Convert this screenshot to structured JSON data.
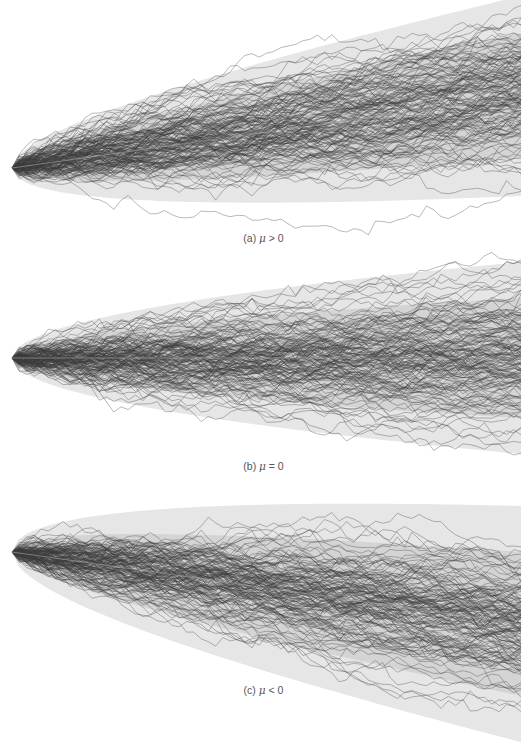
{
  "chart_data": [
    {
      "type": "line",
      "title": "(a) μ > 0",
      "caption_prefix": "(a)",
      "condition": "μ > 0",
      "description": "Simulated random walk paths with positive drift; fan of confidence bands widening over time",
      "n_paths": 150,
      "n_steps": 70,
      "drift_px_per_step": -1.03,
      "step_sigma_px": 5.0,
      "origin": {
        "x": 12,
        "y": 168
      },
      "x_end": 521,
      "mean_end_y": 96,
      "bands": {
        "outer_half_width_end": 100,
        "inner_half_width_end": 62
      },
      "xlabel": "",
      "ylabel": "",
      "grid": false
    },
    {
      "type": "line",
      "title": "(b) μ = 0",
      "caption_prefix": "(b)",
      "condition": "μ = 0",
      "description": "Simulated random walk paths with zero drift; symmetric fan of confidence bands",
      "n_paths": 150,
      "n_steps": 70,
      "drift_px_per_step": 0,
      "step_sigma_px": 5.0,
      "origin": {
        "x": 12,
        "y": 358
      },
      "x_end": 521,
      "mean_end_y": 358,
      "bands": {
        "outer_half_width_end": 96,
        "inner_half_width_end": 60
      },
      "xlabel": "",
      "ylabel": "",
      "grid": false
    },
    {
      "type": "line",
      "title": "(c) μ < 0",
      "caption_prefix": "(c)",
      "condition": "μ < 0",
      "description": "Simulated random walk paths with negative drift; fan of confidence bands widening over time",
      "n_paths": 150,
      "n_steps": 70,
      "drift_px_per_step": 1.03,
      "step_sigma_px": 5.0,
      "origin": {
        "x": 12,
        "y": 552
      },
      "x_end": 521,
      "mean_end_y": 624,
      "bands": {
        "outer_half_width_end": 118,
        "inner_half_width_end": 72
      },
      "xlabel": "",
      "ylabel": "",
      "grid": false
    }
  ],
  "captions": {
    "a": {
      "prefix": "(a)",
      "symbol": "μ",
      "relation": "> 0"
    },
    "b": {
      "prefix": "(b)",
      "symbol": "μ",
      "relation": "= 0"
    },
    "c": {
      "prefix": "(c)",
      "symbol": "μ",
      "relation": "< 0"
    }
  },
  "colors": {
    "outer_band": "#e6e6e6",
    "inner_band": "#d4d4d4",
    "path_stroke": "#3a3a3a",
    "caption_text": "#555555",
    "background": "#ffffff"
  }
}
